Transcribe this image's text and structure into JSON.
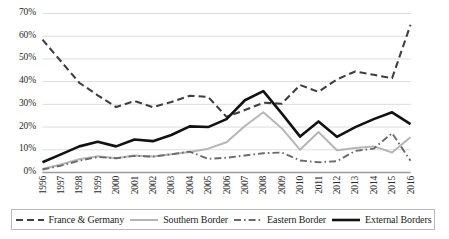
{
  "chart_data": {
    "type": "line",
    "title": "",
    "subtitle": "",
    "xlabel": "",
    "ylabel": "",
    "x": [
      1996,
      1997,
      1998,
      1999,
      2000,
      2001,
      2002,
      2003,
      2004,
      2005,
      2006,
      2007,
      2008,
      2009,
      2010,
      2011,
      2012,
      2013,
      2014,
      2015,
      2016
    ],
    "categories": [
      "1996",
      "1997",
      "1998",
      "1999",
      "2000",
      "2001",
      "2002",
      "2003",
      "2004",
      "2005",
      "2006",
      "2007",
      "2008",
      "2009",
      "2010",
      "2011",
      "2012",
      "2013",
      "2014",
      "2015",
      "2016"
    ],
    "ylim": [
      0,
      70
    ],
    "ytick_labels": [
      "0%",
      "10%",
      "20%",
      "30%",
      "40%",
      "50%",
      "60%",
      "70%"
    ],
    "ytick_values": [
      0,
      10,
      20,
      30,
      40,
      50,
      60,
      70
    ],
    "grid": "horizontal",
    "legend_position": "bottom",
    "value_unit": "percent",
    "series": [
      {
        "name": "France & Germany",
        "style": "dashed",
        "color": "#3f3f3f",
        "width": 2.1,
        "values": [
          58.5,
          49.0,
          39.5,
          34.0,
          28.8,
          31.5,
          28.8,
          31.0,
          33.8,
          33.3,
          24.5,
          27.5,
          30.7,
          30.3,
          38.5,
          35.5,
          41.0,
          44.5,
          43.0,
          41.5,
          65.0
        ]
      },
      {
        "name": "Southern Border",
        "style": "solid",
        "color": "#b6b6b6",
        "width": 2.0,
        "values": [
          1.5,
          3.5,
          5.8,
          7.2,
          6.3,
          7.5,
          7.0,
          8.0,
          9.0,
          10.5,
          13.3,
          20.5,
          26.5,
          19.5,
          10.0,
          17.8,
          9.8,
          10.8,
          11.5,
          8.8,
          15.5
        ]
      },
      {
        "name": "Eastern Border",
        "style": "dashdot",
        "color": "#6b6b6b",
        "width": 1.9,
        "values": [
          1.3,
          3.0,
          5.2,
          6.8,
          6.3,
          7.3,
          7.0,
          8.0,
          9.2,
          6.0,
          6.5,
          7.5,
          8.5,
          8.8,
          5.3,
          4.5,
          5.0,
          9.5,
          10.5,
          17.3,
          5.2
        ]
      },
      {
        "name": "External Borders",
        "style": "solid",
        "color": "#121212",
        "width": 2.6,
        "values": [
          4.5,
          8.0,
          11.5,
          13.5,
          11.5,
          14.5,
          13.8,
          16.5,
          20.3,
          20.0,
          23.5,
          31.8,
          35.8,
          26.0,
          15.8,
          22.5,
          15.7,
          20.0,
          23.5,
          26.5,
          21.3
        ]
      }
    ]
  },
  "legend": {
    "items": [
      {
        "label": "France & Germany",
        "swatch": "dashed-line-swatch"
      },
      {
        "label": "Southern Border",
        "swatch": "solid-light-line-swatch"
      },
      {
        "label": "Eastern Border",
        "swatch": "dashdot-line-swatch"
      },
      {
        "label": "External Borders",
        "swatch": "solid-bold-line-swatch"
      }
    ]
  }
}
